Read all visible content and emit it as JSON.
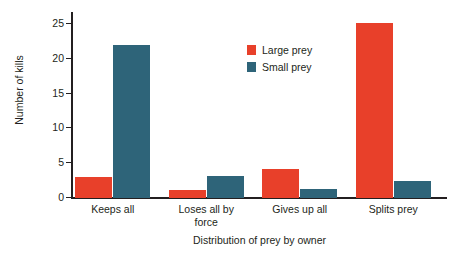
{
  "chart_data": {
    "type": "bar",
    "title": "",
    "subtitle": "",
    "xlabel": "Distribution of prey by owner",
    "ylabel": "Number of kills",
    "categories": [
      "Keeps all",
      "Loses all by force",
      "Gives up all",
      "Splits prey"
    ],
    "category_lines": [
      [
        "Keeps all"
      ],
      [
        "Loses all by",
        "force"
      ],
      [
        "Gives up all"
      ],
      [
        "Splits prey"
      ]
    ],
    "series": [
      {
        "name": "Large prey",
        "color": "#e8402a",
        "values": [
          3.0,
          1.2,
          4.2,
          25.2
        ]
      },
      {
        "name": "Small prey",
        "color": "#2e6479",
        "values": [
          22.0,
          3.2,
          1.3,
          2.5
        ]
      }
    ],
    "ylim": [
      0,
      26.6
    ],
    "yticks": [
      0,
      5,
      10,
      15,
      20,
      25
    ],
    "ytick_labels": [
      "0",
      "5",
      "10",
      "15",
      "20",
      "25"
    ],
    "grid": false,
    "legend_position": "upper center-right",
    "legend_entries": [
      "Large prey",
      "Small prey"
    ],
    "axis_color": "#231f20",
    "background": "#ffffff"
  }
}
